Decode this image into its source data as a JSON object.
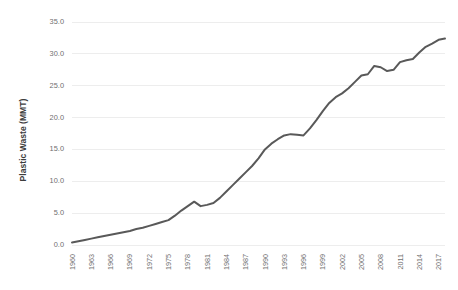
{
  "chart_data": {
    "type": "line",
    "title": "",
    "subtitle": "",
    "xlabel": "",
    "ylabel": "Plastic Waste (MMT)",
    "grid": "horizontal",
    "legend": "none",
    "xlim": [
      1960,
      2018
    ],
    "ylim": [
      0.0,
      35.0
    ],
    "ytick_labels": [
      "0.0",
      "5.0",
      "10.0",
      "15.0",
      "20.0",
      "25.0",
      "30.0",
      "35.0"
    ],
    "ytick_values": [
      0.0,
      5.0,
      10.0,
      15.0,
      20.0,
      25.0,
      30.0,
      35.0
    ],
    "xtick_labels": [
      "1960",
      "1963",
      "1966",
      "1969",
      "1972",
      "1975",
      "1978",
      "1981",
      "1984",
      "1987",
      "1990",
      "1993",
      "1996",
      "1999",
      "2002",
      "2005",
      "2008",
      "2011",
      "2014",
      "2017"
    ],
    "xtick_values": [
      1960,
      1963,
      1966,
      1969,
      1972,
      1975,
      1978,
      1981,
      1984,
      1987,
      1990,
      1993,
      1996,
      1999,
      2002,
      2005,
      2008,
      2011,
      2014,
      2017
    ],
    "line_color": "#595959",
    "grid_color": "#ededed",
    "x": [
      1960,
      1961,
      1962,
      1963,
      1964,
      1965,
      1966,
      1967,
      1968,
      1969,
      1970,
      1971,
      1972,
      1973,
      1974,
      1975,
      1976,
      1977,
      1978,
      1979,
      1980,
      1981,
      1982,
      1983,
      1984,
      1985,
      1986,
      1987,
      1988,
      1989,
      1990,
      1991,
      1992,
      1993,
      1994,
      1995,
      1996,
      1997,
      1998,
      1999,
      2000,
      2001,
      2002,
      2003,
      2004,
      2005,
      2006,
      2007,
      2008,
      2009,
      2010,
      2011,
      2012,
      2013,
      2014,
      2015,
      2016,
      2017,
      2018
    ],
    "values": [
      0.4,
      0.6,
      0.8,
      1.0,
      1.2,
      1.4,
      1.6,
      1.8,
      2.0,
      2.2,
      2.5,
      2.7,
      3.0,
      3.3,
      3.6,
      3.9,
      4.6,
      5.4,
      6.1,
      6.8,
      6.1,
      6.3,
      6.6,
      7.4,
      8.4,
      9.4,
      10.4,
      11.4,
      12.4,
      13.6,
      15.0,
      15.9,
      16.6,
      17.2,
      17.4,
      17.3,
      17.2,
      18.3,
      19.6,
      21.0,
      22.3,
      23.2,
      23.8,
      24.6,
      25.6,
      26.6,
      26.8,
      28.1,
      27.9,
      27.3,
      27.5,
      28.7,
      29.0,
      29.2,
      30.2,
      31.1,
      31.6,
      32.2,
      32.4
    ],
    "series": [
      {
        "name": "Plastic Waste",
        "values": [
          0.4,
          0.6,
          0.8,
          1.0,
          1.2,
          1.4,
          1.6,
          1.8,
          2.0,
          2.2,
          2.5,
          2.7,
          3.0,
          3.3,
          3.6,
          3.9,
          4.6,
          5.4,
          6.1,
          6.8,
          6.1,
          6.3,
          6.6,
          7.4,
          8.4,
          9.4,
          10.4,
          11.4,
          12.4,
          13.6,
          15.0,
          15.9,
          16.6,
          17.2,
          17.4,
          17.3,
          17.2,
          18.3,
          19.6,
          21.0,
          22.3,
          23.2,
          23.8,
          24.6,
          25.6,
          26.6,
          26.8,
          28.1,
          27.9,
          27.3,
          27.5,
          28.7,
          29.0,
          29.2,
          30.2,
          31.1,
          31.6,
          32.2,
          32.4
        ]
      }
    ]
  }
}
